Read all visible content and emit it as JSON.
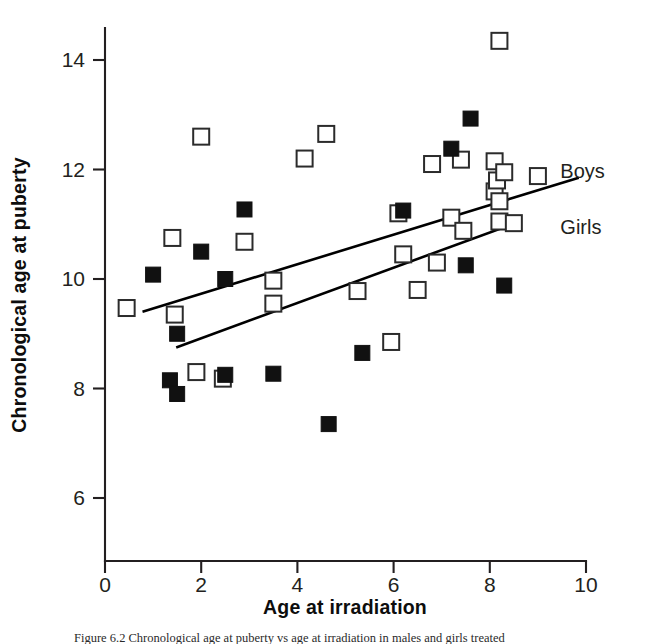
{
  "chart_data": {
    "type": "scatter",
    "title": "",
    "xlabel": "Age at irradiation",
    "ylabel": "Chronological age at puberty",
    "xlim": [
      0,
      10
    ],
    "ylim": [
      5.0,
      14.8
    ],
    "xticks": [
      0,
      2,
      4,
      6,
      8,
      10
    ],
    "yticks": [
      6,
      8,
      10,
      12,
      14
    ],
    "xtick_labels": [
      "0",
      "2",
      "4",
      "6",
      "8",
      "10"
    ],
    "ytick_labels": [
      "6",
      "8",
      "10",
      "12",
      "14"
    ],
    "grid": false,
    "legend_position": "right-inline",
    "series": [
      {
        "name": "Boys",
        "marker": "filled-square",
        "color": "#111111",
        "points": [
          [
            1.0,
            10.08
          ],
          [
            2.0,
            10.5
          ],
          [
            2.5,
            10.0
          ],
          [
            2.9,
            11.27
          ],
          [
            1.5,
            9.0
          ],
          [
            1.35,
            8.15
          ],
          [
            1.5,
            7.9
          ],
          [
            2.5,
            8.25
          ],
          [
            3.5,
            8.27
          ],
          [
            4.65,
            7.35
          ],
          [
            5.35,
            8.65
          ],
          [
            6.2,
            11.25
          ],
          [
            7.2,
            12.38
          ],
          [
            7.6,
            12.93
          ],
          [
            7.5,
            10.25
          ],
          [
            8.3,
            9.88
          ]
        ]
      },
      {
        "name": "Girls",
        "marker": "open-square",
        "color": "#ffffff",
        "points": [
          [
            0.45,
            9.47
          ],
          [
            1.45,
            9.35
          ],
          [
            1.4,
            10.75
          ],
          [
            1.9,
            8.3
          ],
          [
            2.0,
            12.6
          ],
          [
            2.45,
            8.18
          ],
          [
            2.9,
            10.68
          ],
          [
            3.5,
            9.55
          ],
          [
            3.5,
            9.97
          ],
          [
            4.15,
            12.2
          ],
          [
            4.6,
            12.65
          ],
          [
            5.25,
            9.78
          ],
          [
            5.95,
            8.85
          ],
          [
            6.1,
            11.2
          ],
          [
            6.2,
            10.45
          ],
          [
            6.5,
            9.8
          ],
          [
            6.8,
            12.1
          ],
          [
            6.9,
            10.3
          ],
          [
            7.2,
            11.12
          ],
          [
            7.4,
            12.18
          ],
          [
            7.45,
            10.88
          ],
          [
            8.1,
            12.15
          ],
          [
            8.1,
            11.6
          ],
          [
            8.15,
            11.8
          ],
          [
            8.3,
            11.95
          ],
          [
            8.2,
            11.42
          ],
          [
            8.2,
            11.05
          ],
          [
            8.5,
            11.02
          ],
          [
            8.2,
            14.35
          ],
          [
            9.0,
            11.88
          ]
        ]
      }
    ],
    "fit_lines": [
      {
        "name": "Boys",
        "x0": 0.78,
        "y0": 9.4,
        "x1": 9.85,
        "y1": 11.85
      },
      {
        "name": "Girls",
        "x0": 1.48,
        "y0": 8.75,
        "x1": 8.62,
        "y1": 11.05
      }
    ],
    "annotations": [
      {
        "name": "Boys",
        "x": 9.3,
        "y": 11.97,
        "text": "Boys"
      },
      {
        "name": "Girls",
        "x": 9.3,
        "y": 10.95,
        "text": "Girls"
      }
    ]
  },
  "axes": {
    "x_title": "Age at irradiation",
    "y_title": "Chronological age at puberty"
  },
  "caption": {
    "text": "Figure 6.2  Chronological age at puberty vs age at irradiation in males and girls treated"
  }
}
